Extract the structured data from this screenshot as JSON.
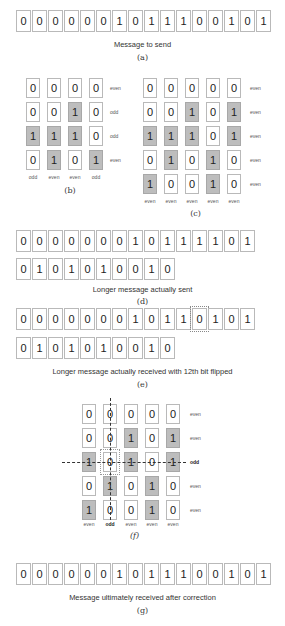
{
  "panel_a": {
    "bits": [
      "0",
      "0",
      "0",
      "0",
      "0",
      "0",
      "1",
      "0",
      "1",
      "1",
      "1",
      "0",
      "0",
      "1",
      "0",
      "1"
    ],
    "caption": "Message to send",
    "label": "(a)"
  },
  "panel_b": {
    "grid": [
      [
        "0",
        "0",
        "0",
        "0"
      ],
      [
        "0",
        "0",
        "1",
        "0"
      ],
      [
        "1",
        "1",
        "1",
        "0"
      ],
      [
        "0",
        "1",
        "0",
        "1"
      ]
    ],
    "row_labels": [
      "even",
      "odd",
      "odd",
      "even"
    ],
    "col_labels": [
      "odd",
      "even",
      "even",
      "odd"
    ],
    "label": "(b)"
  },
  "panel_c": {
    "grid": [
      [
        "0",
        "0",
        "0",
        "0",
        "0"
      ],
      [
        "0",
        "0",
        "1",
        "0",
        "1"
      ],
      [
        "1",
        "1",
        "1",
        "0",
        "1"
      ],
      [
        "0",
        "1",
        "0",
        "1",
        "0"
      ],
      [
        "1",
        "0",
        "0",
        "1",
        "0"
      ]
    ],
    "row_labels": [
      "even",
      "even",
      "even",
      "even",
      "even"
    ],
    "col_labels": [
      "even",
      "even",
      "even",
      "even",
      "even"
    ],
    "label": "(c)"
  },
  "panel_d": {
    "row1": [
      "0",
      "0",
      "0",
      "0",
      "0",
      "0",
      "0",
      "1",
      "0",
      "1",
      "1",
      "1",
      "1",
      "0",
      "1"
    ],
    "row2": [
      "0",
      "1",
      "0",
      "1",
      "0",
      "1",
      "0",
      "0",
      "1",
      "0"
    ],
    "caption": "Longer message actually sent",
    "label": "(d)"
  },
  "panel_e": {
    "row1": [
      "0",
      "0",
      "0",
      "0",
      "0",
      "0",
      "0",
      "1",
      "0",
      "1",
      "1",
      "0",
      "1",
      "0",
      "1"
    ],
    "row2": [
      "0",
      "1",
      "0",
      "1",
      "0",
      "1",
      "0",
      "0",
      "1",
      "0"
    ],
    "flipped_index": 11,
    "caption": "Longer message actually received with 12th bit flipped",
    "label": "(e)"
  },
  "panel_f": {
    "grid": [
      [
        "0",
        "0",
        "0",
        "0",
        "0"
      ],
      [
        "0",
        "0",
        "1",
        "0",
        "1"
      ],
      [
        "1",
        "0",
        "1",
        "0",
        "1"
      ],
      [
        "0",
        "1",
        "0",
        "1",
        "0"
      ],
      [
        "1",
        "0",
        "0",
        "1",
        "0"
      ]
    ],
    "row_labels": [
      "even",
      "even",
      "odd",
      "even",
      "even"
    ],
    "col_labels": [
      "even",
      "odd",
      "even",
      "even",
      "even"
    ],
    "error_row": 2,
    "error_col": 1,
    "label": "(f)"
  },
  "panel_g": {
    "bits": [
      "0",
      "0",
      "0",
      "0",
      "0",
      "0",
      "1",
      "0",
      "1",
      "1",
      "1",
      "0",
      "0",
      "1",
      "0",
      "1"
    ],
    "caption": "Message ultimately received after correction",
    "label": "(g)"
  },
  "colors": {
    "shaded_cell": "#bdbdbd",
    "cell_border": "#b9b9b9"
  }
}
